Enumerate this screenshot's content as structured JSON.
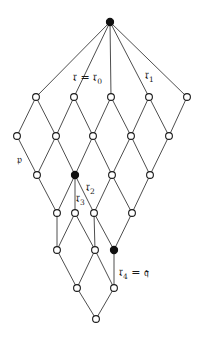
{
  "diagram": {
    "type": "lattice",
    "nodes": [
      {
        "id": "top",
        "filled": true
      },
      {
        "id": "a1",
        "filled": false
      },
      {
        "id": "a2",
        "filled": false
      },
      {
        "id": "a3",
        "filled": false
      },
      {
        "id": "a4",
        "filled": false
      },
      {
        "id": "a5",
        "filled": false
      },
      {
        "id": "b1",
        "filled": false
      },
      {
        "id": "b2",
        "filled": false
      },
      {
        "id": "b3",
        "filled": false
      },
      {
        "id": "b4",
        "filled": false
      },
      {
        "id": "b5",
        "filled": false
      },
      {
        "id": "c1",
        "filled": false
      },
      {
        "id": "c2",
        "filled": true
      },
      {
        "id": "c3",
        "filled": false
      },
      {
        "id": "c4",
        "filled": false
      },
      {
        "id": "d1",
        "filled": false
      },
      {
        "id": "d2",
        "filled": false
      },
      {
        "id": "d3",
        "filled": false
      },
      {
        "id": "d4",
        "filled": false
      },
      {
        "id": "e1",
        "filled": false
      },
      {
        "id": "e2",
        "filled": false
      },
      {
        "id": "e3",
        "filled": true
      },
      {
        "id": "f1",
        "filled": false
      },
      {
        "id": "f2",
        "filled": false
      },
      {
        "id": "bottom",
        "filled": false
      }
    ],
    "edges": [
      [
        "top",
        "a1"
      ],
      [
        "top",
        "a2"
      ],
      [
        "top",
        "a3"
      ],
      [
        "top",
        "a4"
      ],
      [
        "top",
        "a5"
      ],
      [
        "a1",
        "b1"
      ],
      [
        "a1",
        "b2"
      ],
      [
        "a2",
        "b2"
      ],
      [
        "a2",
        "b3"
      ],
      [
        "a3",
        "b3"
      ],
      [
        "a3",
        "b4"
      ],
      [
        "a4",
        "b4"
      ],
      [
        "a4",
        "b5"
      ],
      [
        "a5",
        "b5"
      ],
      [
        "b1",
        "c1"
      ],
      [
        "b2",
        "c1"
      ],
      [
        "b2",
        "c2"
      ],
      [
        "b3",
        "c2"
      ],
      [
        "b3",
        "c3"
      ],
      [
        "b4",
        "c3"
      ],
      [
        "b4",
        "c4"
      ],
      [
        "b5",
        "c4"
      ],
      [
        "c1",
        "d1"
      ],
      [
        "c2",
        "d1"
      ],
      [
        "c2",
        "d2"
      ],
      [
        "c2",
        "d3"
      ],
      [
        "c3",
        "d3"
      ],
      [
        "c3",
        "d4"
      ],
      [
        "c4",
        "d4"
      ],
      [
        "d1",
        "e1"
      ],
      [
        "d2",
        "e1"
      ],
      [
        "d2",
        "e2"
      ],
      [
        "d3",
        "e2"
      ],
      [
        "d3",
        "e3"
      ],
      [
        "d4",
        "e3"
      ],
      [
        "e1",
        "f1"
      ],
      [
        "e2",
        "f1"
      ],
      [
        "e2",
        "f2"
      ],
      [
        "e3",
        "f2"
      ],
      [
        "f1",
        "bottom"
      ],
      [
        "f2",
        "bottom"
      ]
    ],
    "labels": {
      "r0": {
        "main": "𝔯 = 𝔯",
        "sub": "0"
      },
      "r1": {
        "main": "𝔯",
        "sub": "1"
      },
      "p": {
        "main": "𝔭"
      },
      "r2": {
        "main": "𝔯",
        "sub": "2"
      },
      "r3": {
        "main": "𝔯",
        "sub": "3"
      },
      "r4": {
        "main": "𝔯",
        "sub": "4",
        "suffix": " = 𝔮"
      }
    }
  }
}
